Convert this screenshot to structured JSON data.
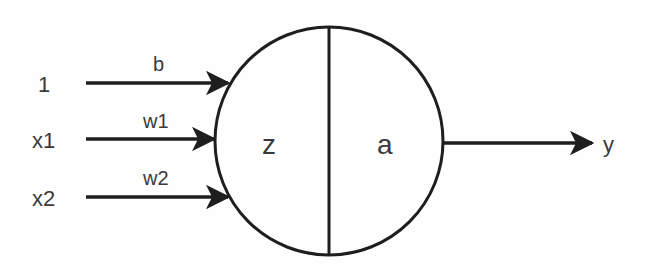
{
  "diagram": {
    "type": "single neuron (perceptron)",
    "inputs": [
      {
        "label": "1",
        "weight_label": "b"
      },
      {
        "label": "x1",
        "weight_label": "w1"
      },
      {
        "label": "x2",
        "weight_label": "w2"
      }
    ],
    "neuron": {
      "left_label": "z",
      "right_label": "a"
    },
    "output": {
      "label": "y"
    },
    "colors": {
      "stroke": "#1e1e1e",
      "text": "#3a3a3a",
      "background": "#fefefe"
    }
  }
}
